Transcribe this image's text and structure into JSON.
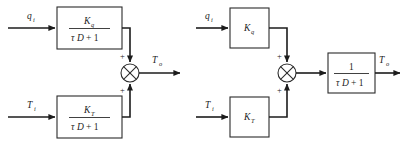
{
  "figure": {
    "background_color": "#ffffff",
    "line_color": "#1c1c1c",
    "box_stroke_color": "#2b2b2b"
  },
  "diagrams": [
    {
      "id": "left-diagram",
      "name": "parallel-form",
      "inputs": [
        {
          "label": "q",
          "subscript": "i",
          "name": "input-qi"
        },
        {
          "label": "T",
          "subscript": "i",
          "name": "input-Ti"
        }
      ],
      "blocks": [
        {
          "name": "block-kq-over-tau",
          "type": "fraction",
          "numerator": "K",
          "numerator_sub": "q",
          "denominator_tau": "τ",
          "denominator_D": "D",
          "denominator_rest": "+ 1"
        },
        {
          "name": "block-kt-over-tau",
          "type": "fraction",
          "numerator": "K",
          "numerator_sub": "T",
          "denominator_tau": "τ",
          "denominator_D": "D",
          "denominator_rest": "+ 1"
        }
      ],
      "summing_junction": {
        "name": "summing-junction-left",
        "glyph": "cross-circle",
        "sign_top": "+",
        "sign_bottom": "+"
      },
      "output": {
        "label": "T",
        "subscript": "o",
        "name": "output-To"
      }
    },
    {
      "id": "right-diagram",
      "name": "factored-form",
      "inputs": [
        {
          "label": "q",
          "subscript": "i",
          "name": "input-qi"
        },
        {
          "label": "T",
          "subscript": "i",
          "name": "input-Ti"
        }
      ],
      "blocks": [
        {
          "name": "block-kq",
          "type": "gain",
          "label": "K",
          "label_sub": "q"
        },
        {
          "name": "block-kt",
          "type": "gain",
          "label": "K",
          "label_sub": "T"
        },
        {
          "name": "block-one-over-tau",
          "type": "fraction",
          "numerator": "1",
          "numerator_sub": "",
          "denominator_tau": "τ",
          "denominator_D": "D",
          "denominator_rest": "+ 1"
        }
      ],
      "summing_junction": {
        "name": "summing-junction-right",
        "glyph": "cross-circle",
        "sign_top": "+",
        "sign_bottom": "+"
      },
      "output": {
        "label": "T",
        "subscript": "o",
        "name": "output-To"
      }
    }
  ]
}
